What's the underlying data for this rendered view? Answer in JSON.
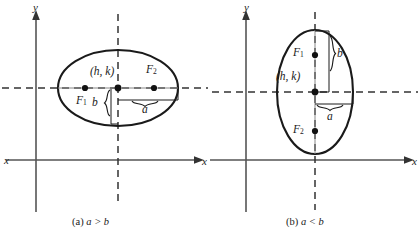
{
  "figure": {
    "background_color": "#ffffff",
    "stroke_color": "#1a1a1a",
    "axis_color": "#555555",
    "dash_color": "#333333"
  },
  "panels": [
    {
      "id": "a",
      "caption_prefix": "(a)",
      "caption_body": "a > b",
      "caption_full": "(a) a > b",
      "orientation": "horizontal-major-axis",
      "axis_x_label": "x",
      "axis_y_label": "y",
      "center_label": "(h, k)",
      "focus1_label": "F",
      "focus1_sub": "1",
      "focus2_label": "F",
      "focus2_sub": "2",
      "semi_major_label": "a",
      "semi_minor_label": "b",
      "geometry": {
        "center": [
          118,
          88
        ],
        "semi_axis_horizontal": 60,
        "semi_axis_vertical": 38,
        "focus1": [
          85,
          88
        ],
        "focus2": [
          154,
          88
        ],
        "origin": [
          36,
          160
        ],
        "x_axis_y": 160,
        "y_axis_x": 36
      }
    },
    {
      "id": "b",
      "caption_prefix": "(b)",
      "caption_body": "a < b",
      "caption_full": "(b) a < b",
      "orientation": "vertical-major-axis",
      "axis_x_label": "x",
      "axis_y_label": "y",
      "center_label": "(h, k)",
      "focus1_label": "F",
      "focus1_sub": "1",
      "focus2_label": "F",
      "focus2_sub": "2",
      "semi_major_label": "b",
      "semi_minor_label": "a",
      "geometry": {
        "center": [
          105,
          92
        ],
        "semi_axis_horizontal": 38,
        "semi_axis_vertical": 62,
        "focus1": [
          105,
          55
        ],
        "focus2": [
          105,
          131
        ],
        "origin": [
          36,
          160
        ],
        "x_axis_y": 160,
        "y_axis_x": 36
      }
    }
  ],
  "left_margin_label": "x"
}
